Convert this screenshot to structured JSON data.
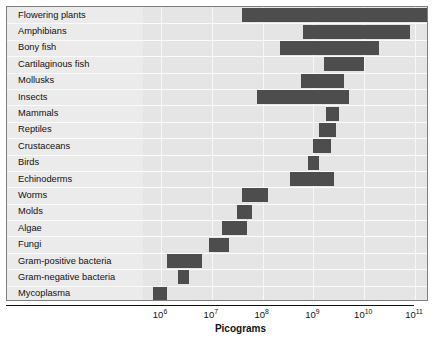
{
  "chart_data": {
    "type": "bar",
    "orientation": "horizontal",
    "title": "",
    "xlabel": "Picograms",
    "ylabel": "",
    "xscale": "log",
    "xlim": [
      300000,
      200000000000
    ],
    "grid": true,
    "legend": null,
    "bar_color": "#4d4d4d",
    "xticks": [
      {
        "label": "10",
        "exponent": "6",
        "value": 1000000
      },
      {
        "label": "10",
        "exponent": "7",
        "value": 10000000
      },
      {
        "label": "10",
        "exponent": "8",
        "value": 100000000
      },
      {
        "label": "10",
        "exponent": "9",
        "value": 1000000000
      },
      {
        "label": "10",
        "exponent": "10",
        "value": 10000000000
      },
      {
        "label": "10",
        "exponent": "11",
        "value": 100000000000
      }
    ],
    "categories": [
      "Flowering plants",
      "Amphibians",
      "Bony fish",
      "Cartilaginous fish",
      "Mollusks",
      "Insects",
      "Mammals",
      "Reptiles",
      "Crustaceans",
      "Birds",
      "Echinoderms",
      "Worms",
      "Molds",
      "Algae",
      "Fungi",
      "Gram-positive bacteria",
      "Gram-negative bacteria",
      "Mycoplasma"
    ],
    "ranges": [
      {
        "category": "Flowering plants",
        "low": 40000000.0,
        "high": 200000000000.0
      },
      {
        "category": "Amphibians",
        "low": 630000000.0,
        "high": 79000000000.0
      },
      {
        "category": "Bony fish",
        "low": 220000000.0,
        "high": 20000000000.0
      },
      {
        "category": "Cartilaginous fish",
        "low": 1600000000.0,
        "high": 10000000000.0
      },
      {
        "category": "Mollusks",
        "low": 560000000.0,
        "high": 4000000000.0
      },
      {
        "category": "Insects",
        "low": 79000000.0,
        "high": 5000000000.0
      },
      {
        "category": "Mammals",
        "low": 1800000000.0,
        "high": 3200000000.0
      },
      {
        "category": "Reptiles",
        "low": 1300000000.0,
        "high": 2800000000.0
      },
      {
        "category": "Crustaceans",
        "low": 1000000000.0,
        "high": 2200000000.0
      },
      {
        "category": "Birds",
        "low": 790000000.0,
        "high": 1300000000.0
      },
      {
        "category": "Echinoderms",
        "low": 350000000.0,
        "high": 2500000000.0
      },
      {
        "category": "Worms",
        "low": 40000000.0,
        "high": 130000000.0
      },
      {
        "category": "Molds",
        "low": 32000000.0,
        "high": 63000000.0
      },
      {
        "category": "Algae",
        "low": 16000000.0,
        "high": 50000000.0
      },
      {
        "category": "Fungi",
        "low": 8900000.0,
        "high": 22000000.0
      },
      {
        "category": "Gram-positive bacteria",
        "low": 1300000.0,
        "high": 6300000.0
      },
      {
        "category": "Gram-negative bacteria",
        "low": 2200000.0,
        "high": 3500000.0
      },
      {
        "category": "Mycoplasma",
        "low": 710000.0,
        "high": 1300000.0
      }
    ]
  }
}
